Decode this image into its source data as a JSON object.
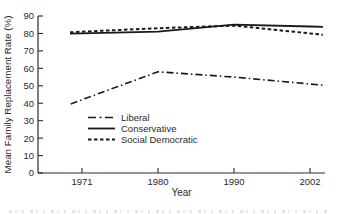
{
  "chart_data": {
    "type": "line",
    "title": "",
    "xlabel": "Year",
    "ylabel": "Mean Family Replacement Rate (%)",
    "categories": [
      "1971",
      "1980",
      "1990",
      "2002"
    ],
    "yticks": [
      0,
      10,
      20,
      30,
      40,
      50,
      60,
      70,
      80,
      90
    ],
    "ylim": [
      0,
      90
    ],
    "grid": false,
    "legend_position": "inside-lower-left",
    "line_color": "#1a1a1a",
    "text_color": "#2a2a2a",
    "series": [
      {
        "name": "Liberal",
        "style": "dashdot",
        "values": [
          42,
          58,
          55,
          51
        ]
      },
      {
        "name": "Conservative",
        "style": "solid",
        "values": [
          80,
          81,
          85,
          84
        ]
      },
      {
        "name": "Social Democratic",
        "style": "dashed",
        "values": [
          81,
          83,
          84.5,
          80
        ]
      }
    ]
  }
}
